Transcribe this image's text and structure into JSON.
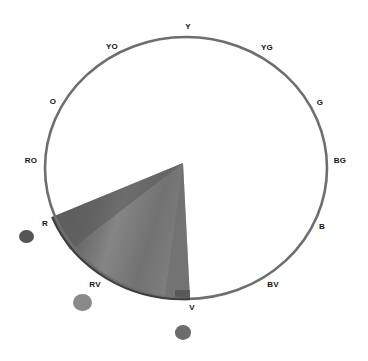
{
  "diagram": {
    "type": "color-wheel-hue-range",
    "ring_color": "#6e6e6e",
    "wedge": {
      "from_hue": "R",
      "to_hue": "V",
      "description": "Shaded wedge spanning red through red-violet to violet",
      "color_dark": "#5a5a5a",
      "color_mid": "#7a7a7a",
      "color_light": "#8e8e8e"
    },
    "hue_labels": [
      {
        "id": "Y",
        "text": "Y",
        "x": 188,
        "y": 26
      },
      {
        "id": "YG",
        "text": "YG",
        "x": 267,
        "y": 47
      },
      {
        "id": "G",
        "text": "G",
        "x": 320,
        "y": 102
      },
      {
        "id": "BG",
        "text": "BG",
        "x": 340,
        "y": 160
      },
      {
        "id": "B",
        "text": "B",
        "x": 322,
        "y": 226
      },
      {
        "id": "BV",
        "text": "BV",
        "x": 273,
        "y": 284
      },
      {
        "id": "V",
        "text": "V",
        "x": 192,
        "y": 307
      },
      {
        "id": "RV",
        "text": "RV",
        "x": 95,
        "y": 284
      },
      {
        "id": "R",
        "text": "R",
        "x": 45,
        "y": 223
      },
      {
        "id": "RO",
        "text": "RO",
        "x": 31,
        "y": 160
      },
      {
        "id": "O",
        "text": "O",
        "x": 53,
        "y": 101
      },
      {
        "id": "YO",
        "text": "YO",
        "x": 112,
        "y": 46
      }
    ],
    "swatches": [
      {
        "id": "swatch-r",
        "hue": "R",
        "x": 26,
        "y": 237,
        "size": 15,
        "color": "#555555"
      },
      {
        "id": "swatch-rv",
        "hue": "RV",
        "x": 82,
        "y": 303,
        "size": 19,
        "color": "#8a8a8a"
      },
      {
        "id": "swatch-v",
        "hue": "V",
        "x": 183,
        "y": 333,
        "size": 16,
        "color": "#6c6c6c"
      }
    ]
  }
}
